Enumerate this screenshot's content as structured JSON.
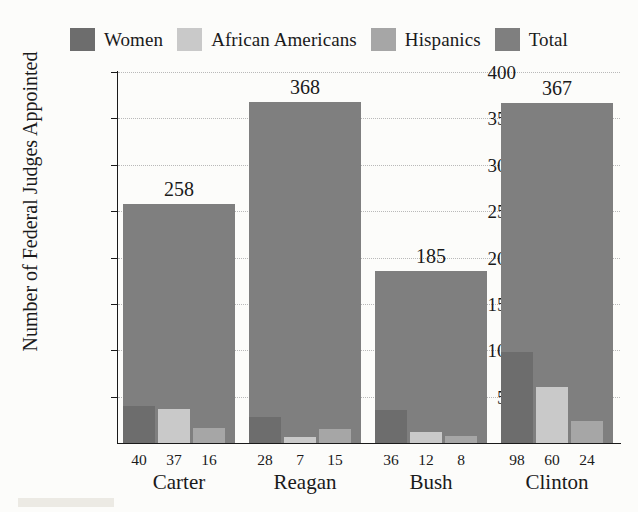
{
  "chart_data": {
    "type": "bar",
    "title": "",
    "subtitle": "",
    "xlabel": "",
    "ylabel": "Number of Federal Judges Appointed",
    "ylim": [
      0,
      400
    ],
    "yticks": [
      400,
      350,
      300,
      250,
      200,
      150,
      100,
      50
    ],
    "grid": true,
    "legend_position": "top",
    "categories": [
      "Carter",
      "Reagan",
      "Bush",
      "Clinton"
    ],
    "series": [
      {
        "name": "Women",
        "values": [
          40,
          28,
          36,
          98
        ]
      },
      {
        "name": "African Americans",
        "values": [
          37,
          7,
          12,
          60
        ]
      },
      {
        "name": "Hispanics",
        "values": [
          16,
          15,
          8,
          24
        ]
      },
      {
        "name": "Total",
        "values": [
          258,
          368,
          185,
          367
        ]
      }
    ],
    "annotations": [
      {
        "category": "Carter",
        "text": "258"
      },
      {
        "category": "Reagan",
        "text": "368"
      },
      {
        "category": "Bush",
        "text": "185"
      },
      {
        "category": "Clinton",
        "text": "367"
      }
    ],
    "colors": {
      "women": "#6d6d6d",
      "african_americans": "#c9c9c9",
      "hispanics": "#a6a6a6",
      "total": "#7f7f7f",
      "gridline": "#b9b9b9",
      "axis": "#1a1a1a",
      "background": "#fcfcfa"
    }
  },
  "legend": {
    "items": [
      {
        "label": "Women",
        "color": "#6d6d6d"
      },
      {
        "label": "African Americans",
        "color": "#c9c9c9"
      },
      {
        "label": "Hispanics",
        "color": "#a6a6a6"
      },
      {
        "label": "Total",
        "color": "#7f7f7f"
      }
    ]
  },
  "axes": {
    "y_title": "Number of Federal Judges Appointed",
    "y_tick_labels": [
      "400",
      "350",
      "300",
      "250",
      "200",
      "150",
      "100",
      "50"
    ]
  },
  "groups": [
    {
      "name": "Carter",
      "total_label": "258",
      "sub_labels": [
        "40",
        "37",
        "16"
      ],
      "values": {
        "women": 40,
        "african_americans": 37,
        "hispanics": 16,
        "total": 258
      }
    },
    {
      "name": "Reagan",
      "total_label": "368",
      "sub_labels": [
        "28",
        "7",
        "15"
      ],
      "values": {
        "women": 28,
        "african_americans": 7,
        "hispanics": 15,
        "total": 368
      }
    },
    {
      "name": "Bush",
      "total_label": "185",
      "sub_labels": [
        "36",
        "12",
        "8"
      ],
      "values": {
        "women": 36,
        "african_americans": 12,
        "hispanics": 8,
        "total": 185
      }
    },
    {
      "name": "Clinton",
      "total_label": "367",
      "sub_labels": [
        "98",
        "60",
        "24"
      ],
      "values": {
        "women": 98,
        "african_americans": 60,
        "hispanics": 24,
        "total": 367
      }
    }
  ]
}
